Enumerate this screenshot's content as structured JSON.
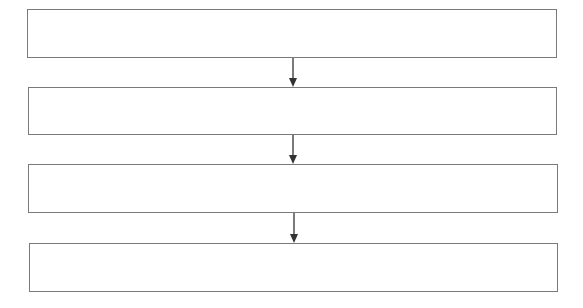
{
  "diagram": {
    "type": "vertical-flowchart",
    "colors": {
      "box_border": "#7a7a7a",
      "box_fill": "#ffffff",
      "arrow": "#333333",
      "background": "#ffffff"
    },
    "boxes": [
      {
        "label": "",
        "x": 27,
        "y": 9,
        "w": 530,
        "h": 49
      },
      {
        "label": "",
        "x": 28,
        "y": 87,
        "w": 529,
        "h": 48
      },
      {
        "label": "",
        "x": 28,
        "y": 164,
        "w": 530,
        "h": 49
      },
      {
        "label": "",
        "x": 29,
        "y": 243,
        "w": 529,
        "h": 49
      }
    ],
    "arrows": [
      {
        "from": 0,
        "to": 1,
        "x": 293,
        "y1": 58,
        "y2": 87
      },
      {
        "from": 1,
        "to": 2,
        "x": 293,
        "y1": 135,
        "y2": 164
      },
      {
        "from": 2,
        "to": 3,
        "x": 294,
        "y1": 213,
        "y2": 243
      }
    ]
  }
}
